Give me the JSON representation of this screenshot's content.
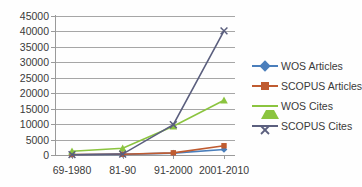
{
  "chart_data": {
    "type": "line",
    "title": "",
    "xlabel": "",
    "ylabel": "",
    "categories": [
      "69-1980",
      "81-90",
      "91-2000",
      "2001-2010"
    ],
    "ylim": [
      0,
      45000
    ],
    "ytick_step": 5000,
    "yticks": [
      "45000",
      "40000",
      "35000",
      "30000",
      "25000",
      "20000",
      "15000",
      "10000",
      "5000",
      "0"
    ],
    "grid": true,
    "legend_position": "right",
    "series": [
      {
        "name": "WOS Articles",
        "values": [
          100,
          200,
          600,
          1800
        ],
        "color": "#4a7ebb",
        "marker": "diamond"
      },
      {
        "name": "SCOPUS Articles",
        "values": [
          150,
          250,
          700,
          3000
        ],
        "color": "#bf5b30",
        "marker": "square"
      },
      {
        "name": "WOS Cites",
        "values": [
          1200,
          2200,
          9300,
          17700
        ],
        "color": "#8bc43f",
        "marker": "triangle"
      },
      {
        "name": "SCOPUS Cites",
        "values": [
          100,
          300,
          9800,
          40200
        ],
        "color": "#5b5f7e",
        "marker": "x"
      }
    ]
  },
  "legend": {
    "items": [
      {
        "label": "WOS Articles"
      },
      {
        "label": "SCOPUS Articles"
      },
      {
        "label": "WOS Cites"
      },
      {
        "label": "SCOPUS Cites"
      }
    ]
  },
  "axis": {
    "y_labels": [
      "45000",
      "40000",
      "35000",
      "30000",
      "25000",
      "20000",
      "15000",
      "10000",
      "5000",
      "0"
    ],
    "x_labels": [
      "69-1980",
      "81-90",
      "91-2000",
      "2001-2010"
    ]
  }
}
